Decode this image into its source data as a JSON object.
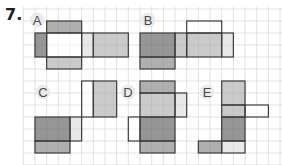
{
  "question": {
    "number": "7."
  },
  "grid": {
    "origin_x": 23.3,
    "origin_y": 9,
    "cell_w": 11.67,
    "cell_h": 12,
    "cols": 22,
    "rows": 13,
    "start_y": 7,
    "line_color": "#d9d9d9"
  },
  "colors": {
    "dark": "#8d8d8d",
    "medium": "#a8a8a8",
    "light": "#c6c6c6",
    "pale": "#e6e6e6",
    "white": "#ffffff",
    "stroke": "#3c3c3c",
    "label_bg": "#ebebeb",
    "label_text": "#4a4a4a"
  },
  "nets": [
    {
      "label": "A",
      "label_x": 37,
      "label_y": 20,
      "faces": [
        {
          "c": 2,
          "r": 1,
          "w": 3,
          "h": 1,
          "fill": "medium"
        },
        {
          "c": 1,
          "r": 2,
          "w": 1,
          "h": 2,
          "fill": "dark"
        },
        {
          "c": 2,
          "r": 2,
          "w": 3,
          "h": 2,
          "fill": "white"
        },
        {
          "c": 5,
          "r": 2,
          "w": 1,
          "h": 2,
          "fill": "pale"
        },
        {
          "c": 6,
          "r": 2,
          "w": 3,
          "h": 2,
          "fill": "light"
        },
        {
          "c": 2,
          "r": 4,
          "w": 3,
          "h": 1,
          "fill": "light"
        }
      ]
    },
    {
      "label": "B",
      "label_x": 148,
      "label_y": 20,
      "faces": [
        {
          "c": 14,
          "r": 1,
          "w": 3,
          "h": 1,
          "fill": "white"
        },
        {
          "c": 10,
          "r": 2,
          "w": 3,
          "h": 2,
          "fill": "dark"
        },
        {
          "c": 13,
          "r": 2,
          "w": 1,
          "h": 2,
          "fill": "light"
        },
        {
          "c": 14,
          "r": 2,
          "w": 3,
          "h": 2,
          "fill": "light"
        },
        {
          "c": 17,
          "r": 2,
          "w": 1,
          "h": 2,
          "fill": "pale"
        },
        {
          "c": 10,
          "r": 4,
          "w": 3,
          "h": 1,
          "fill": "medium"
        }
      ]
    },
    {
      "label": "C",
      "label_x": 43,
      "label_y": 92,
      "faces": [
        {
          "c": 5,
          "r": 6,
          "w": 1,
          "h": 3,
          "fill": "white"
        },
        {
          "c": 6,
          "r": 6,
          "w": 2,
          "h": 3,
          "fill": "light"
        },
        {
          "c": 1,
          "r": 9,
          "w": 3,
          "h": 2,
          "fill": "dark"
        },
        {
          "c": 4,
          "r": 9,
          "w": 1,
          "h": 2,
          "fill": "pale"
        },
        {
          "c": 1,
          "r": 11,
          "w": 3,
          "h": 1,
          "fill": "medium"
        }
      ]
    },
    {
      "label": "D",
      "label_x": 128,
      "label_y": 92,
      "faces": [
        {
          "c": 10,
          "r": 6,
          "w": 3,
          "h": 1,
          "fill": "medium"
        },
        {
          "c": 10,
          "r": 7,
          "w": 3,
          "h": 2,
          "fill": "light"
        },
        {
          "c": 13,
          "r": 7,
          "w": 1,
          "h": 2,
          "fill": "pale"
        },
        {
          "c": 9,
          "r": 9,
          "w": 1,
          "h": 2,
          "fill": "white"
        },
        {
          "c": 10,
          "r": 9,
          "w": 3,
          "h": 2,
          "fill": "dark"
        },
        {
          "c": 10,
          "r": 11,
          "w": 3,
          "h": 1,
          "fill": "medium"
        }
      ]
    },
    {
      "label": "E",
      "label_x": 207,
      "label_y": 92,
      "faces": [
        {
          "c": 17,
          "r": 6,
          "w": 2,
          "h": 2,
          "fill": "light"
        },
        {
          "c": 17,
          "r": 8,
          "w": 2,
          "h": 1,
          "fill": "light"
        },
        {
          "c": 19,
          "r": 8,
          "w": 2,
          "h": 1,
          "fill": "white"
        },
        {
          "c": 17,
          "r": 9,
          "w": 2,
          "h": 2,
          "fill": "dark"
        },
        {
          "c": 15,
          "r": 11,
          "w": 2,
          "h": 1,
          "fill": "medium"
        },
        {
          "c": 17,
          "r": 11,
          "w": 2,
          "h": 1,
          "fill": "pale"
        }
      ]
    }
  ]
}
